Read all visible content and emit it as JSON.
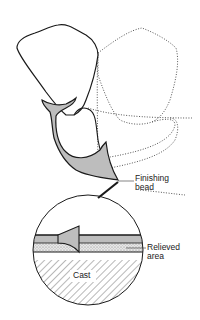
{
  "diagram": {
    "labels": {
      "finishing_bead_line1": "Finishing",
      "finishing_bead_line2": "bead",
      "relieved_area_line1": "Relieved",
      "relieved_area_line2": "area",
      "cast": "Cast"
    },
    "colors": {
      "outline": "#1a1a1a",
      "acrylic_fill": "#bdbdbd",
      "dotted_outline": "#555555",
      "relief_stipple": "#d8d8d8",
      "background": "#ffffff"
    }
  }
}
